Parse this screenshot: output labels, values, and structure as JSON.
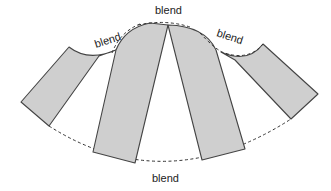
{
  "diagram": {
    "type": "fan-pattern-pieces",
    "pieces": [
      {
        "name": "left-outer-piece"
      },
      {
        "name": "center-left-piece"
      },
      {
        "name": "center-right-piece"
      },
      {
        "name": "right-outer-piece"
      }
    ],
    "labels": {
      "top": "blend",
      "upper_left": "blend",
      "upper_right": "blend",
      "bottom": "blend"
    },
    "colors": {
      "piece_fill": "#cfcfcf",
      "outline": "#444444",
      "dashed_line": "#333333",
      "background": "#ffffff"
    }
  }
}
